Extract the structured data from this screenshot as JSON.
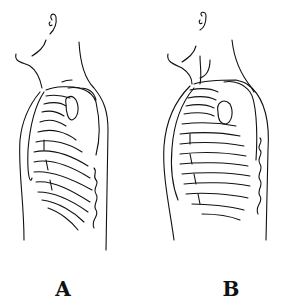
{
  "figure": {
    "panels": [
      {
        "label": "A",
        "variant": "normal-chest"
      },
      {
        "label": "B",
        "variant": "barrel-chest"
      }
    ],
    "colors": {
      "line": "#111111",
      "background": "#ffffff"
    }
  }
}
